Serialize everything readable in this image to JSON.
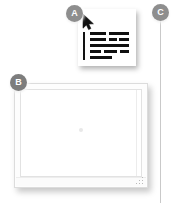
{
  "figure": {
    "background_color": "#ffffff",
    "width": 172,
    "height": 203,
    "badge_color": "#8e8e8e",
    "badge_text_color": "#ffffff",
    "leader_line_color": "#c9c9c9"
  },
  "callouts": [
    {
      "id": "a",
      "label": "A",
      "target": "select-all-icon-card"
    },
    {
      "id": "b",
      "label": "B",
      "target": "application-window"
    },
    {
      "id": "c",
      "label": "C",
      "target": "right-edge-leader-line"
    }
  ],
  "icon_card": {
    "name": "select-all-icon",
    "cursor_icon": "arrow-pointer-icon",
    "dotted_rail_top": "selection-marquee-top",
    "dotted_rail_left": "selection-marquee-left",
    "text_bar_rows": [
      [
        "r1a",
        "r1b"
      ],
      [
        "r2a",
        "r2b",
        "r2c"
      ],
      [
        "r3a"
      ],
      [
        "r4a",
        "r4b",
        "r4c"
      ],
      [
        "r5a"
      ]
    ],
    "bar_color": "#101010",
    "card_background": "#ffffff"
  },
  "window": {
    "name": "application-window",
    "frame_color": "#dcdcdc",
    "content_background": "#ffffff",
    "inner_border_color": "#e2e2e2",
    "status_strip_color": "#fbfbfb",
    "center_marker": "center-dot",
    "resize_grip": "resize-grip-icon",
    "scroll_gutter": "scroll-gutter-rule"
  }
}
